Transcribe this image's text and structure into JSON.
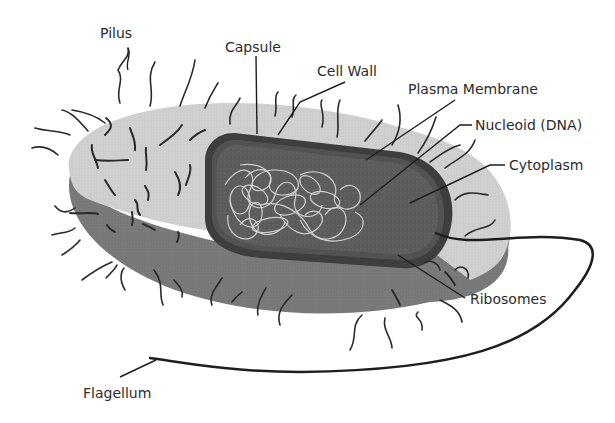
{
  "diagram": {
    "colors": {
      "background": "#ffffff",
      "capsule_top": "#d2d2d2",
      "capsule_side": "#7a7a7a",
      "cell_wall": "#4a4a4a",
      "cytoplasm": "#5e5e5e",
      "dna": "#cfcfcf",
      "pili": "#2a2a2a",
      "label_text": "#2b2b2b"
    },
    "labels": {
      "pilus": "Pilus",
      "capsule": "Capsule",
      "cell_wall": "Cell Wall",
      "plasma_membrane": "Plasma Membrane",
      "nucleoid": "Nucleoid (DNA)",
      "cytoplasm": "Cytoplasm",
      "ribosomes": "Ribosomes",
      "flagellum": "Flagellum"
    }
  }
}
